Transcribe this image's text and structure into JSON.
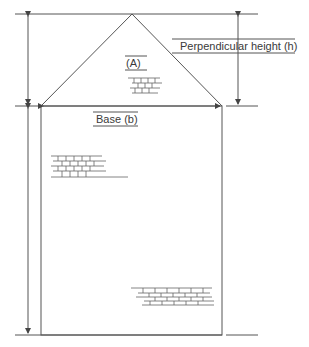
{
  "diagram": {
    "labels": {
      "area_a": "(A)",
      "perpendicular_height": "Perpendicular height (h)",
      "base": "Base (b)"
    },
    "colors": {
      "line": "#555555",
      "background": "#ffffff",
      "text": "#3a3a3a"
    },
    "shapes": {
      "triangle": {
        "apex": [
          132,
          14
        ],
        "base_left": [
          41,
          106
        ],
        "base_right": [
          222,
          106
        ]
      },
      "rectangle": {
        "x": 41,
        "y": 106,
        "width": 181,
        "height": 229
      }
    },
    "brick_patches": [
      {
        "id": "triangle-brick",
        "x": 138,
        "y": 72
      },
      {
        "id": "left-brick",
        "x": 50,
        "y": 152
      },
      {
        "id": "lower-right-brick",
        "x": 132,
        "y": 287
      }
    ]
  }
}
